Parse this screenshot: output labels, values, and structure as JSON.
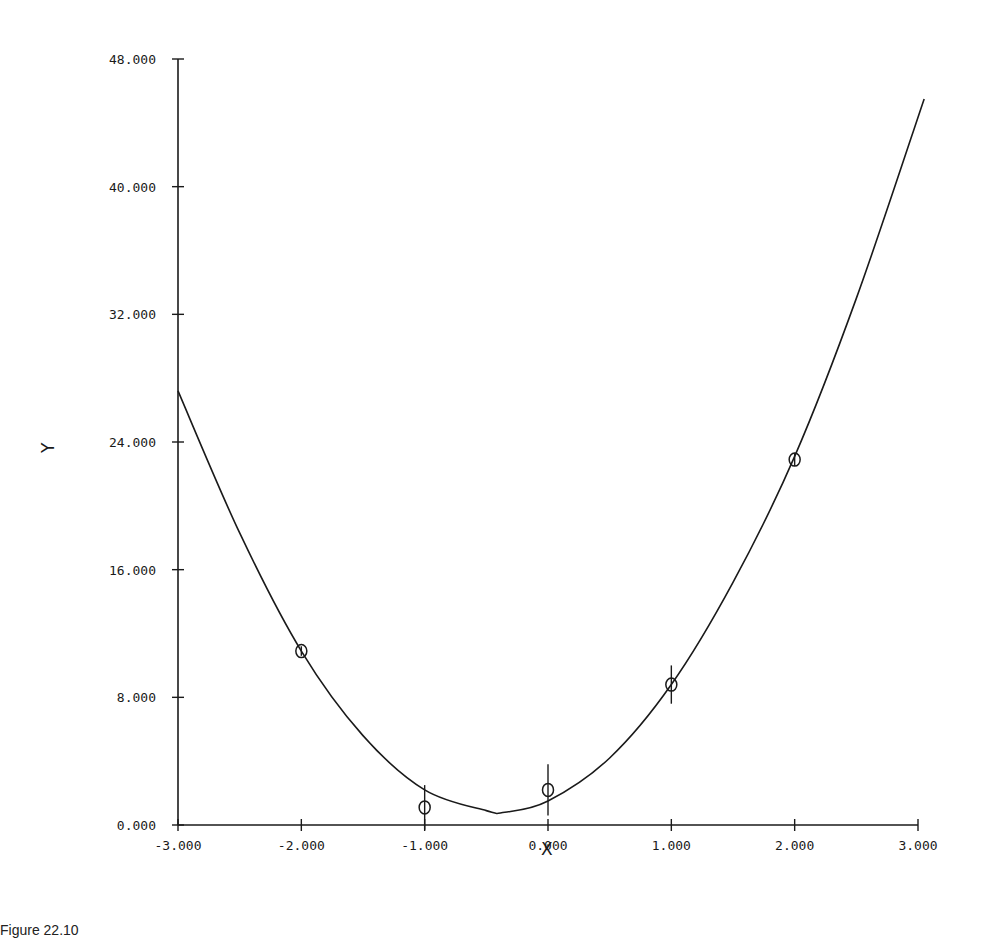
{
  "chart_data": {
    "type": "scatter",
    "title": "",
    "xlabel": "X",
    "ylabel": "Y",
    "xlim": [
      -3.0,
      3.0
    ],
    "ylim": [
      0.0,
      48.0
    ],
    "grid": false,
    "legend": null,
    "x_ticks": [
      "-3.000",
      "-2.000",
      "-1.000",
      "0.000",
      "1.000",
      "2.000",
      "3.000"
    ],
    "y_ticks": [
      "0.000",
      "8.000",
      "16.000",
      "24.000",
      "32.000",
      "40.000",
      "48.000"
    ],
    "x_tick_values": [
      -3,
      -2,
      -1,
      0,
      1,
      2,
      3
    ],
    "y_tick_values": [
      0,
      8,
      16,
      24,
      32,
      40,
      48
    ],
    "series": [
      {
        "name": "data points",
        "type": "scatter",
        "marker": "circle",
        "x": [
          -2.0,
          -1.0,
          0.0,
          1.0,
          2.0
        ],
        "y": [
          10.9,
          1.1,
          2.2,
          8.8,
          22.9
        ],
        "error": [
          0.3,
          1.4,
          1.6,
          1.2,
          0.4
        ]
      },
      {
        "name": "fitted curve",
        "type": "line",
        "x": [
          -3.0,
          -2.5,
          -2.0,
          -1.5,
          -1.0,
          -0.5,
          -0.35,
          0.0,
          0.5,
          1.0,
          1.5,
          2.0,
          2.5,
          3.05
        ],
        "y": [
          27.2,
          18.3,
          10.9,
          5.6,
          2.2,
          0.9,
          0.8,
          1.5,
          4.2,
          8.8,
          15.2,
          23.1,
          33.0,
          45.5
        ]
      }
    ]
  },
  "caption": "Figure 22.10"
}
